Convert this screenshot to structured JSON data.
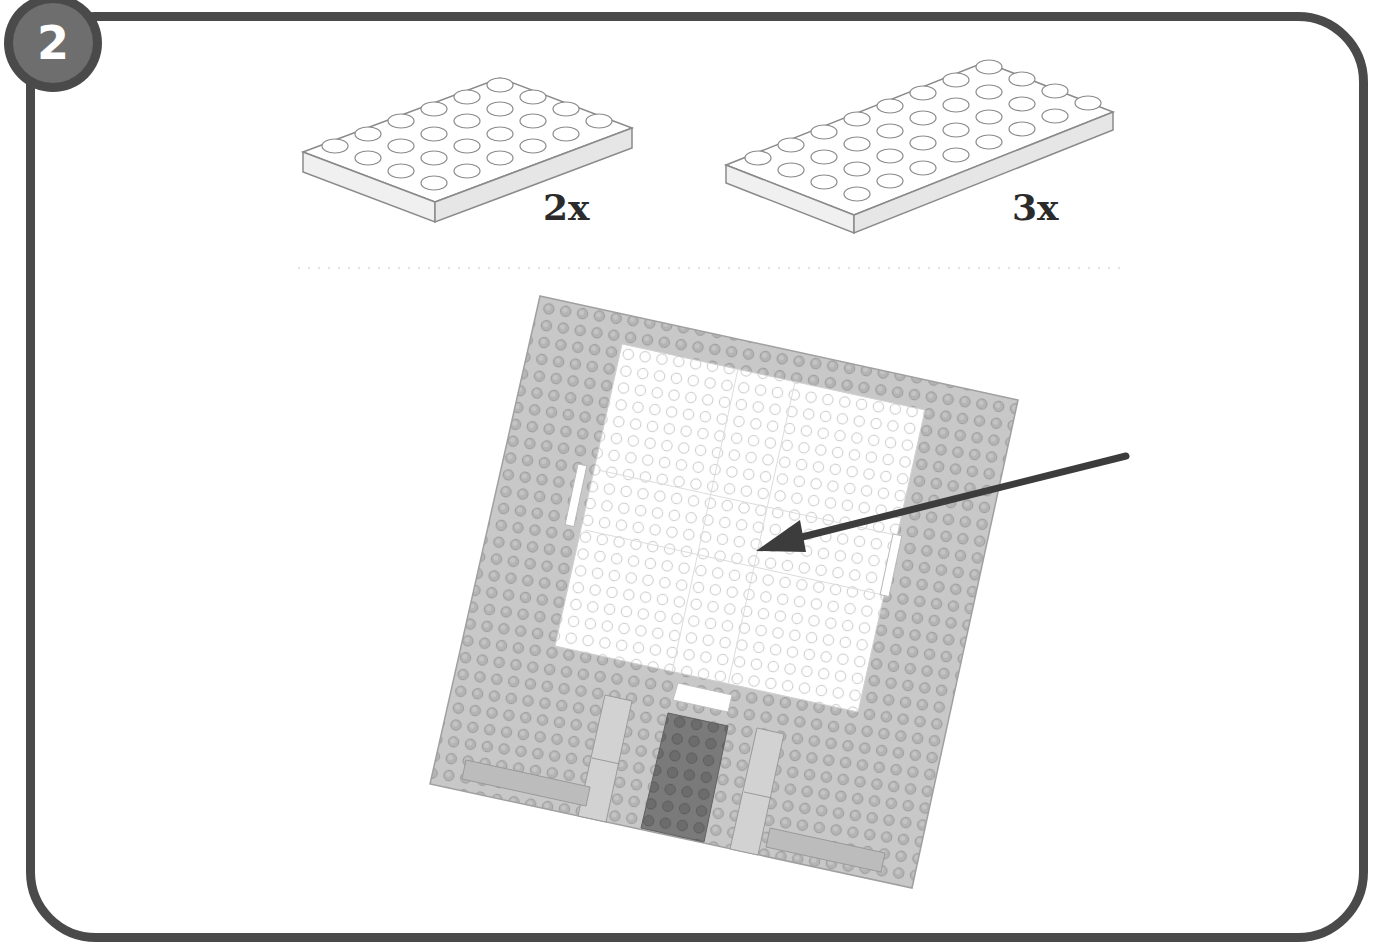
{
  "step": {
    "number": "2"
  },
  "parts": [
    {
      "name": "4x6 plate",
      "color": "white",
      "quantity_label": "2x",
      "studs": [
        4,
        6
      ]
    },
    {
      "name": "4x8 plate",
      "color": "white",
      "quantity_label": "3x",
      "studs": [
        4,
        8
      ]
    }
  ],
  "assembly": {
    "baseplate_color": "#c8c8c8",
    "white_plates_color": "#ffffff",
    "dark_tile_color": "#7a7a7a",
    "light_tile_color": "#d2d2d2",
    "arrow_color": "#3c3c3c"
  },
  "colors": {
    "frame": "#4a4a4a",
    "badge_inner": "#6e6e6e",
    "label_text": "#2b2b2b"
  }
}
